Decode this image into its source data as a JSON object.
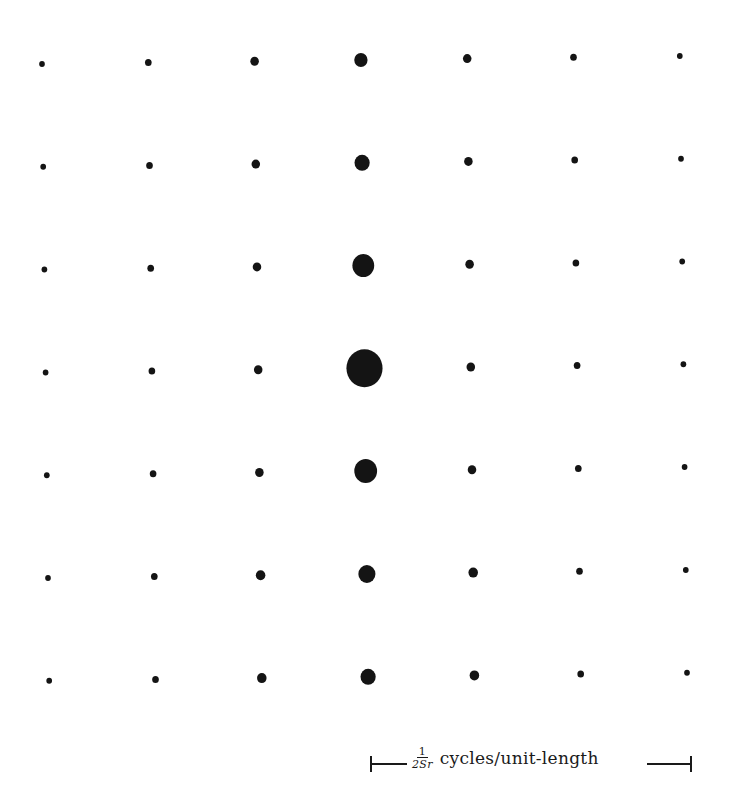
{
  "figure": {
    "type": "lattice-dot-diagram",
    "rows": 7,
    "cols": 7,
    "dot_color": "#141414",
    "background": "#ffffff"
  },
  "lattice": {
    "origin_x": 42,
    "origin_y": 64,
    "col_step_x": 106.3,
    "col_step_y": -1.35,
    "row_step_x": 1.2,
    "row_step_y": 102.8,
    "diameters": [
      [
        6,
        7,
        9,
        14,
        9,
        7,
        6
      ],
      [
        6,
        7,
        9,
        16,
        9,
        7,
        6
      ],
      [
        6,
        7,
        9,
        23,
        9,
        7,
        6
      ],
      [
        6,
        7,
        9,
        38,
        9,
        7,
        6
      ],
      [
        6,
        7,
        9,
        24,
        9,
        7,
        6
      ],
      [
        6,
        7,
        10,
        18,
        10,
        7,
        6
      ],
      [
        6,
        7,
        10,
        16,
        10,
        7,
        6
      ]
    ]
  },
  "scale_bar": {
    "x_start": 371,
    "x_end": 691,
    "y": 764,
    "frac_numerator": "1",
    "frac_denominator": "2Sr",
    "units": "cycles/unit-length"
  }
}
